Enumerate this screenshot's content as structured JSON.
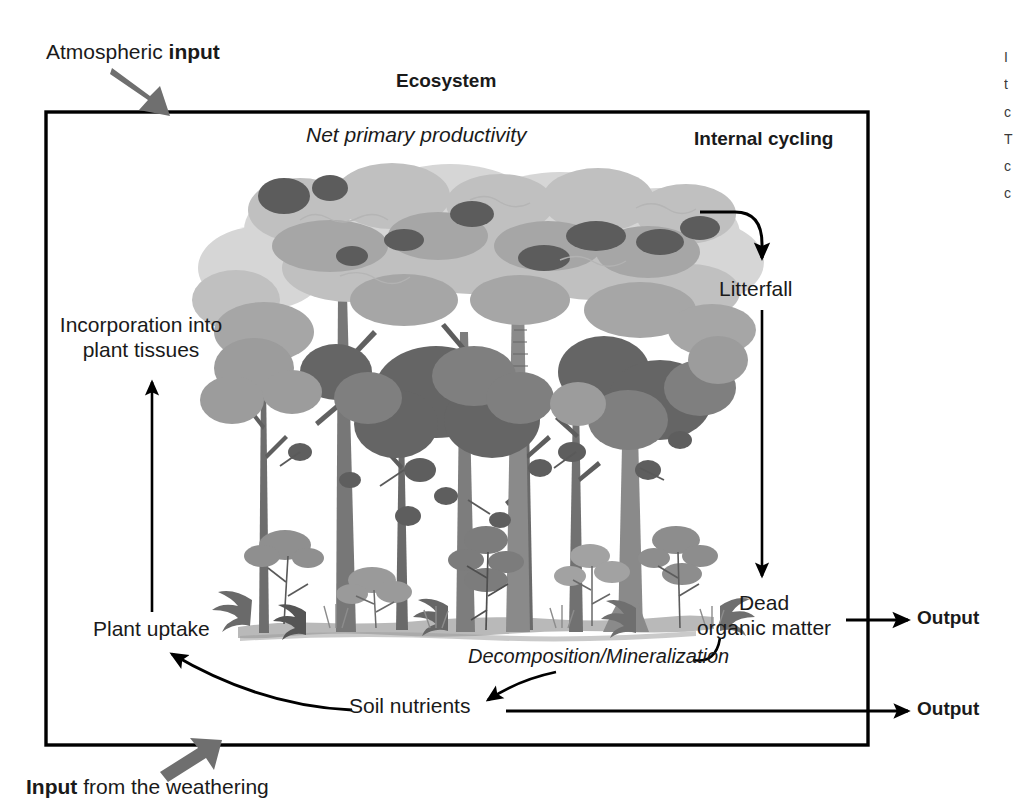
{
  "figure": {
    "title": "Ecosystem",
    "box": {
      "x": 46,
      "y": 112,
      "width": 822,
      "height": 633
    }
  },
  "labels": {
    "atmospheric_input_plain": "Atmospheric ",
    "atmospheric_input_bold": "input",
    "ecosystem": "Ecosystem",
    "net_primary_productivity": "Net primary productivity",
    "internal_cycling": "Internal cycling",
    "litterfall": "Litterfall",
    "incorporation_line1": "Incorporation into",
    "incorporation_line2": "plant tissues",
    "plant_uptake": "Plant uptake",
    "dead_organic_line1": "Dead",
    "dead_organic_line2": "organic matter",
    "decomposition": "Decomposition/Mineralization",
    "soil_nutrients": "Soil nutrients",
    "output_upper": "Output",
    "output_lower": "Output",
    "weathering_input_bold": "Input",
    "weathering_input_plain": " from the weathering"
  },
  "side_caption": {
    "lines": [
      "I",
      "t",
      "c",
      "T",
      "c",
      "c"
    ]
  },
  "illustration": {
    "name": "forest-illustration",
    "ground_color": "#b9b9b9",
    "canopy_tones": [
      "#d8d8d8",
      "#c2c2c2",
      "#a8a8a8",
      "#8e8e8e",
      "#6e6e6e",
      "#545454"
    ],
    "trunk_color": "#7a7a7a",
    "trunk_dark": "#4f4f4f"
  },
  "colors": {
    "border": "#000000",
    "arrow": "#000000",
    "gray_arrow": "#6f6f6f",
    "text": "#1a1a1a",
    "background": "#ffffff"
  }
}
